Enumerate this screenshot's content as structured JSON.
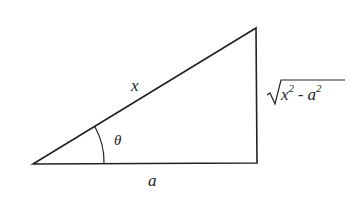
{
  "diagram": {
    "type": "right-triangle",
    "vertices": {
      "left": [
        33,
        164
      ],
      "top_right": [
        256,
        28
      ],
      "bottom_right": [
        257,
        163
      ]
    },
    "labels": {
      "hypotenuse": "x",
      "base": "a",
      "angle": "θ",
      "opposite_base": "x",
      "opposite_exp1": "2",
      "opposite_minus": " - ",
      "opposite_var2": "a",
      "opposite_exp2": "2"
    },
    "opposite_side_expression": "√(x² − a²)",
    "colors": {
      "stroke": "#222222",
      "background": "#ffffff"
    }
  }
}
